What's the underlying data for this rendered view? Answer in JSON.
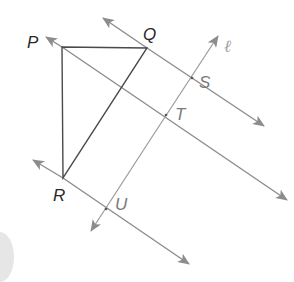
{
  "figure": {
    "points": {
      "P": {
        "label": "P",
        "x": 62,
        "y": 47
      },
      "Q": {
        "label": "Q",
        "x": 147,
        "y": 48
      },
      "R": {
        "label": "R",
        "x": 63,
        "y": 178
      },
      "S": {
        "label": "S",
        "x": 192,
        "y": 78
      },
      "T": {
        "label": "T",
        "x": 166,
        "y": 115
      },
      "U": {
        "label": "U",
        "x": 106,
        "y": 209
      }
    },
    "transversal": {
      "label": "ℓ"
    },
    "colors": {
      "triangle": "#4a4a4a",
      "lines": "#8c8c8c",
      "arrow": "#8c8c8c",
      "label_dark": "#2a2a2a",
      "label_gray": "#7a7a7a"
    }
  },
  "labels": {
    "P": "P",
    "Q": "Q",
    "R": "R",
    "S": "S",
    "T": "T",
    "U": "U",
    "l": "ℓ"
  }
}
